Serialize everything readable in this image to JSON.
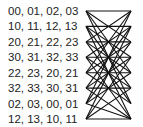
{
  "rows": [
    {
      "label": "00, 01, 02, 03"
    },
    {
      "label": "10, 11, 12, 13"
    },
    {
      "label": "20, 21, 22, 23"
    },
    {
      "label": "30, 31, 32, 33"
    },
    {
      "label": "22, 23, 20, 21"
    },
    {
      "label": "32, 33, 30, 31"
    },
    {
      "label": "02, 03, 00, 01"
    },
    {
      "label": "12, 13, 10, 11"
    }
  ],
  "diagram": {
    "left_nodes": 8,
    "right_nodes": 8,
    "line_color": "#111111",
    "connections": [
      [
        0,
        0
      ],
      [
        0,
        2
      ],
      [
        0,
        4
      ],
      [
        0,
        6
      ],
      [
        1,
        1
      ],
      [
        1,
        3
      ],
      [
        1,
        5
      ],
      [
        1,
        7
      ],
      [
        2,
        0
      ],
      [
        2,
        2
      ],
      [
        2,
        4
      ],
      [
        2,
        6
      ],
      [
        3,
        1
      ],
      [
        3,
        3
      ],
      [
        3,
        5
      ],
      [
        3,
        7
      ],
      [
        4,
        0
      ],
      [
        4,
        2
      ],
      [
        4,
        4
      ],
      [
        4,
        6
      ],
      [
        5,
        1
      ],
      [
        5,
        3
      ],
      [
        5,
        5
      ],
      [
        5,
        7
      ],
      [
        6,
        0
      ],
      [
        6,
        2
      ],
      [
        6,
        4
      ],
      [
        6,
        7
      ],
      [
        7,
        1
      ],
      [
        7,
        3
      ],
      [
        7,
        5
      ],
      [
        7,
        7
      ]
    ]
  }
}
